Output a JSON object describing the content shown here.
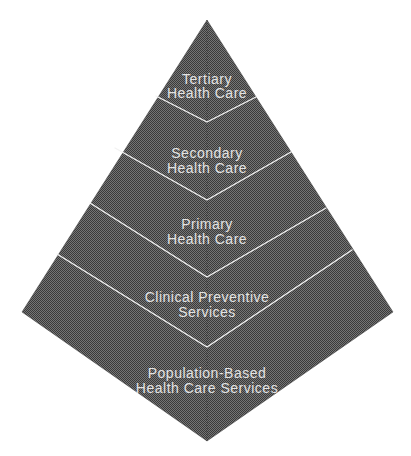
{
  "diagram": {
    "type": "pyramid-kite",
    "colors": {
      "background": "#ffffff",
      "texture_light": "#757575",
      "texture_dark": "#3a3a3a",
      "edge": "#2e2e2e",
      "center_ridge": "#222222",
      "divider": "#f2f2f2",
      "label": "#e3e3e3"
    },
    "levels": [
      {
        "name": "tertiary-health-care",
        "line1": "Tertiary",
        "line2": "Health Care",
        "label": "Tertiary Health Care"
      },
      {
        "name": "secondary-health-care",
        "line1": "Secondary",
        "line2": "Health Care",
        "label": "Secondary Health Care"
      },
      {
        "name": "primary-health-care",
        "line1": "Primary",
        "line2": "Health Care",
        "label": "Primary Health Care"
      },
      {
        "name": "clinical-preventive-services",
        "line1": "Clinical Preventive",
        "line2": "Services",
        "label": "Clinical Preventive Services"
      },
      {
        "name": "population-based-health-care-services",
        "line1": "Population-Based",
        "line2": "Health Care Services",
        "label": "Population-Based Health Care Services"
      }
    ]
  }
}
